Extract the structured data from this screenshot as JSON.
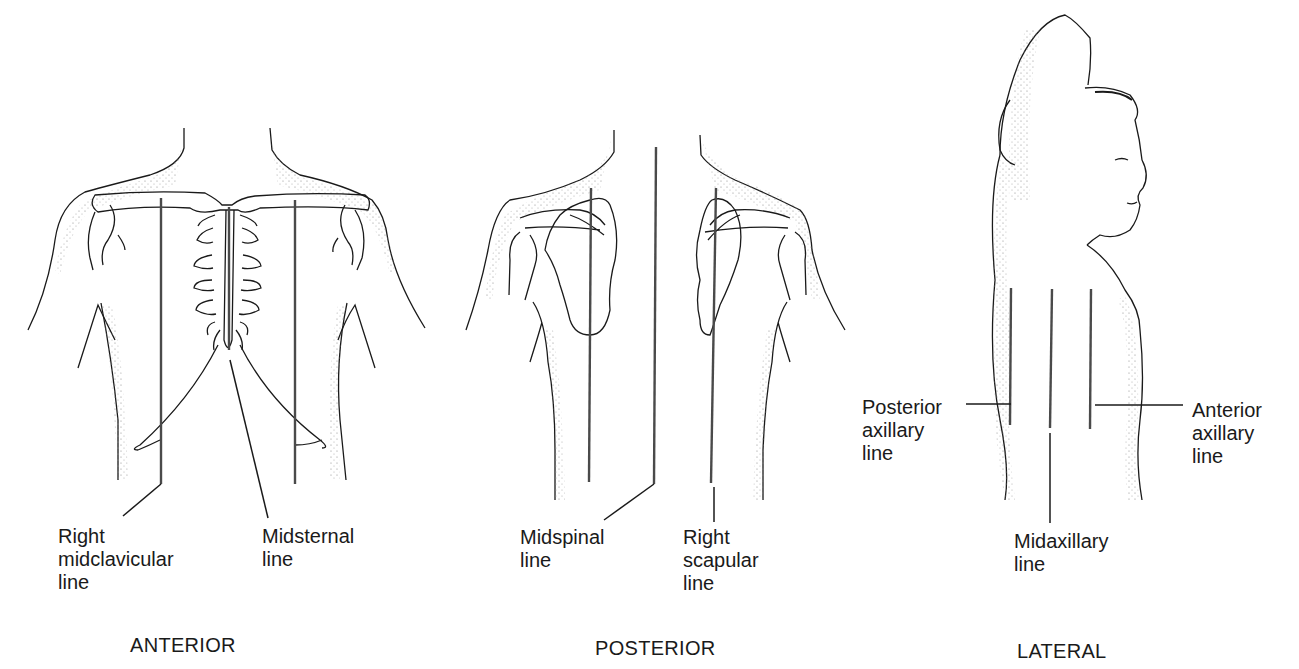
{
  "figures": {
    "anterior": {
      "caption": "ANTERIOR",
      "labels": {
        "right_midclavicular": "Right\nmidclavicular\nline",
        "midsternal": "Midsternal\nline"
      }
    },
    "posterior": {
      "caption": "POSTERIOR",
      "labels": {
        "midspinal": "Midspinal\nline",
        "right_scapular": "Right\nscapular\nline"
      }
    },
    "lateral": {
      "caption": "LATERAL",
      "labels": {
        "posterior_axillary": "Posterior\naxillary\nline",
        "anterior_axillary": "Anterior\naxillary\nline",
        "midaxillary": "Midaxillary\nline"
      }
    }
  },
  "colors": {
    "ink": "#1a1a1a",
    "reference_line": "#4a4a4a",
    "stipple": "#9a9a9a",
    "background": "#ffffff"
  }
}
